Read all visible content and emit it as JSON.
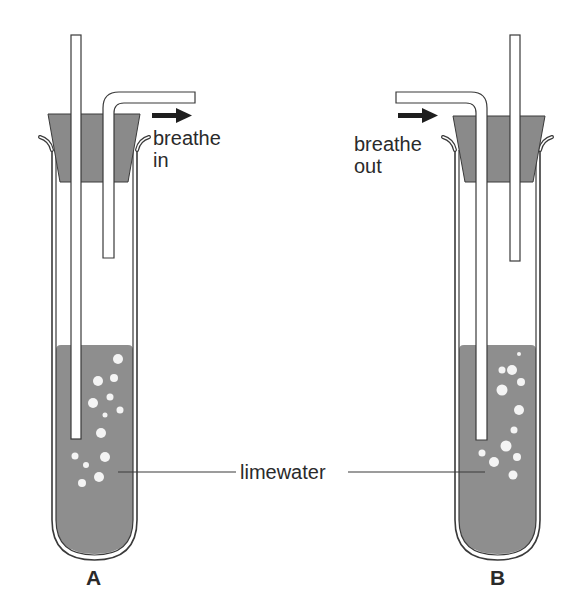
{
  "diagram": {
    "type": "experimental apparatus",
    "colors": {
      "limewater": "#8e8e8e",
      "stopper": "#8a8a8a",
      "outline": "#3a3a3a",
      "bubble": "#f4f4f4",
      "arrow": "#1e1e1e"
    },
    "tubes": [
      {
        "id": "A",
        "label": "A",
        "action_label": "breathe\nin",
        "arrow_direction": "right",
        "description": "Air drawn in through short tube; outside air bubbles through limewater via long tube"
      },
      {
        "id": "B",
        "label": "B",
        "action_label": "breathe\nout",
        "arrow_direction": "right",
        "description": "Exhaled air blown in through bent tube into long tube, bubbling through limewater"
      }
    ],
    "shared_label": "limewater"
  }
}
